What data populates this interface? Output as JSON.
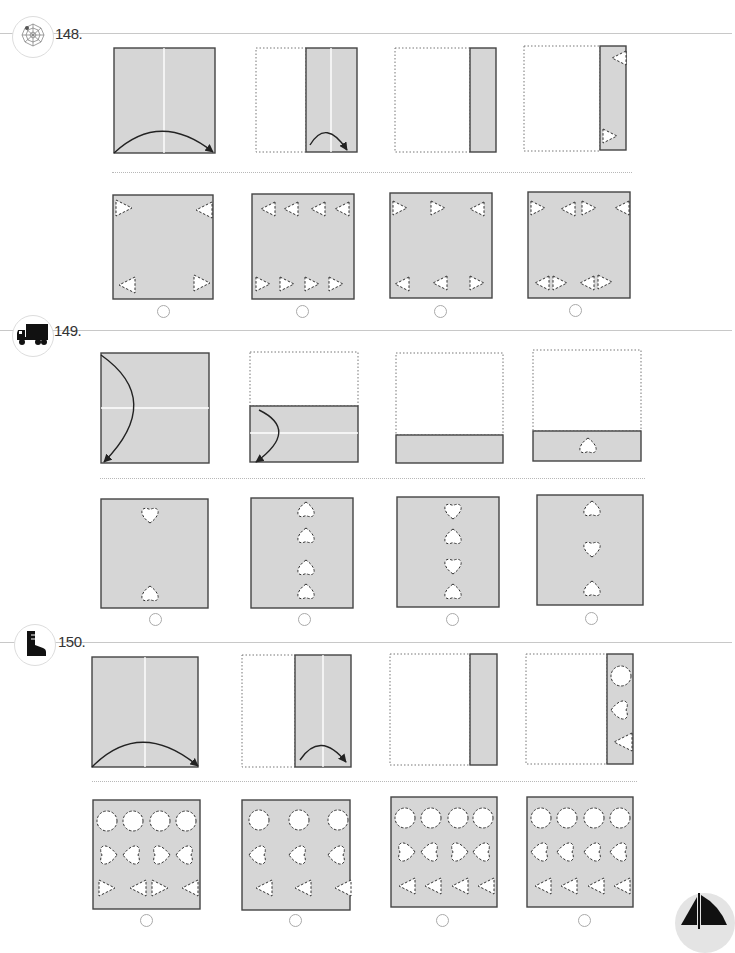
{
  "page": {
    "colors": {
      "paper": "#d6d6d6",
      "border": "#444444",
      "crease": "#ffffff",
      "separator": "#c8c8c8"
    },
    "problems": [
      {
        "number": "148.",
        "icon": "spider-web-icon",
        "fold_steps": [
          "full square, fold left half over right",
          "half folded, fold again",
          "quarter strip",
          "strip with triangle cutouts"
        ],
        "cutout_shape": "triangle",
        "answer_options": [
          {
            "label": "option-a",
            "selected": false,
            "description": "4 triangles at corners"
          },
          {
            "label": "option-b",
            "selected": false,
            "description": "8 triangles in two rows"
          },
          {
            "label": "option-c",
            "selected": false,
            "description": "6 triangles"
          },
          {
            "label": "option-d",
            "selected": false,
            "description": "8 triangles paired"
          }
        ]
      },
      {
        "number": "149.",
        "icon": "truck-icon",
        "fold_steps": [
          "full square, fold top to bottom",
          "half folded, fold again",
          "quarter strip",
          "strip with heart cutout"
        ],
        "cutout_shape": "heart",
        "answer_options": [
          {
            "label": "option-a",
            "selected": false,
            "description": "2 hearts"
          },
          {
            "label": "option-b",
            "selected": false,
            "description": "4 hearts"
          },
          {
            "label": "option-c",
            "selected": false,
            "description": "4 hearts alternating"
          },
          {
            "label": "option-d",
            "selected": false,
            "description": "3 hearts"
          }
        ]
      },
      {
        "number": "150.",
        "icon": "boot-icon",
        "fold_steps": [
          "full square, fold left half over right",
          "half folded, fold again",
          "quarter strip",
          "strip with circle, heart, triangle cutouts"
        ],
        "cutout_shape": "circle-heart-triangle",
        "answer_options": [
          {
            "label": "option-a",
            "selected": false,
            "description": "4 cols mirrored"
          },
          {
            "label": "option-b",
            "selected": false,
            "description": "3 cols"
          },
          {
            "label": "option-c",
            "selected": false,
            "description": "4 cols mixed"
          },
          {
            "label": "option-d",
            "selected": false,
            "description": "4 cols same"
          }
        ]
      }
    ],
    "corner_icon": "sailboat-icon"
  }
}
